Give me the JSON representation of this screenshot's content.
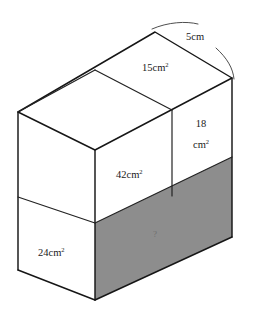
{
  "figure": {
    "type": "geometry-diagram",
    "shape": "rectangular-cuboid",
    "background_color": "#ffffff",
    "edge_color": "#161616",
    "shaded_face_color": "#8d8d8d"
  },
  "labels": {
    "top_face_area": "15cm",
    "top_face_area_exponent": "2",
    "depth_edge": "5cm",
    "right_face_area_value": "18",
    "right_face_area_unit": "cm",
    "right_face_area_exponent": "2",
    "front_upper_area": "42cm",
    "front_upper_area_exponent": "2",
    "left_lower_area": "24cm",
    "left_lower_area_exponent": "2",
    "unknown_face": "?"
  },
  "geometry": {
    "vertices": {
      "top_apex": [
        155,
        32
      ],
      "top_right": [
        232,
        78
      ],
      "top_left": [
        18,
        112
      ],
      "top_front": [
        95,
        150
      ],
      "right_bottom": [
        232,
        237
      ],
      "front_bottom": [
        95,
        300
      ],
      "left_bottom": [
        18,
        270
      ]
    },
    "top_face_divider": [
      [
        95,
        70
      ],
      [
        172,
        110
      ]
    ],
    "right_vertical_divider": [
      [
        172,
        110
      ],
      [
        172,
        196
      ]
    ],
    "left_horizontal_divider": [
      [
        18,
        197
      ],
      [
        95,
        223
      ]
    ],
    "shaded_band_top": [
      [
        95,
        223
      ],
      [
        232,
        157
      ]
    ],
    "shaded_band_bottom": [
      [
        95,
        300
      ],
      [
        232,
        237
      ]
    ]
  },
  "annotations": {
    "brace_upper_arc": "arc above top-right edge",
    "brace_lower_arc": "arc right of top-right edge"
  }
}
